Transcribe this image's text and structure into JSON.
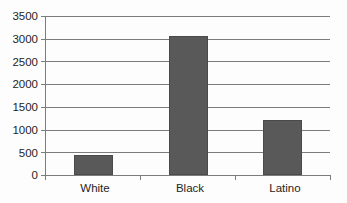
{
  "chart_data": {
    "type": "bar",
    "title": "",
    "subtitle": "",
    "xlabel": "",
    "ylabel": "",
    "categories": [
      "White",
      "Black",
      "Latino"
    ],
    "values": [
      440,
      3060,
      1210
    ],
    "series": [
      {
        "name": "",
        "values": [
          440,
          3060,
          1210
        ]
      }
    ],
    "ylim": [
      0,
      3500
    ],
    "ytick_labels": [
      "0",
      "500",
      "1000",
      "1500",
      "2000",
      "2500",
      "3000",
      "3500"
    ],
    "ytick_values": [
      0,
      500,
      1000,
      1500,
      2000,
      2500,
      3000,
      3500
    ],
    "grid": true,
    "legend": false,
    "legend_position": "none",
    "annotations": [],
    "colors": {
      "bar_fill": "#595959",
      "bar_border": "#4a4a4a",
      "gridline": "#7c7c7c",
      "axis": "#7c7c7c",
      "text": "#242424",
      "background": "#fdfdfd"
    }
  }
}
